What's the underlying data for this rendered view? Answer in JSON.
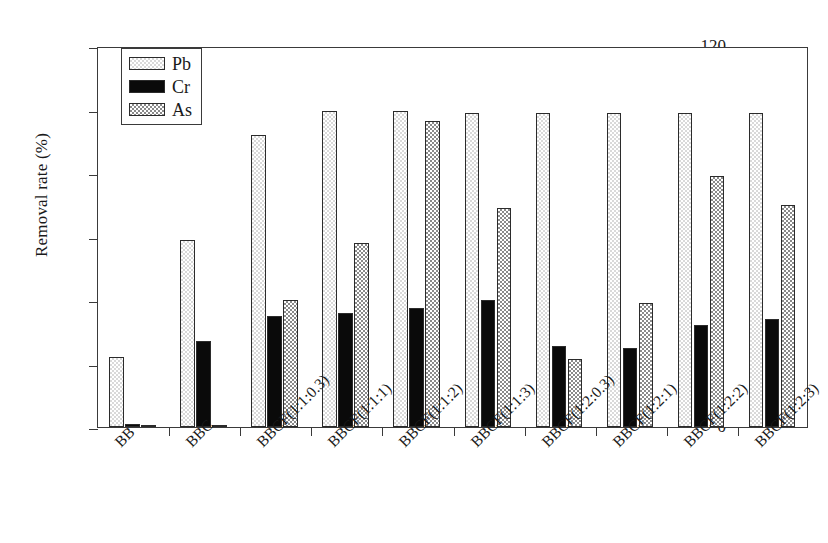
{
  "chart_data": {
    "type": "bar",
    "title": "",
    "xlabel": "",
    "ylabel": "Removal rate (%)",
    "ylim": [
      0,
      120
    ],
    "yticks": [
      0,
      20,
      40,
      60,
      80,
      100,
      120
    ],
    "grid": false,
    "legend_position": "top-left",
    "categories": [
      "BB",
      "BBC",
      "BBCF(1:1:0.3)",
      "BBCF(1:1:1)",
      "BBCF(1:1:2)",
      "BBCF(1:1:3)",
      "BBCF(1:2:0.3)",
      "BBCF(1:2:1)",
      "BBCF(1:2:2)",
      "BBCF(1:2:3)"
    ],
    "series": [
      {
        "name": "Pb",
        "color": "#d9d9d9",
        "pattern": "light-dotted",
        "values": [
          22,
          59,
          92,
          99.5,
          99.5,
          99,
          99,
          99,
          99,
          99
        ]
      },
      {
        "name": "Cr",
        "color": "#0a0a0a",
        "pattern": "solid-black",
        "values": [
          0.8,
          27,
          35,
          36,
          37.5,
          40,
          25.5,
          25,
          32,
          34
        ]
      },
      {
        "name": "As",
        "color": "#8a8a8a",
        "pattern": "dense-dotted",
        "values": [
          0.2,
          0.5,
          40,
          58,
          96.5,
          69,
          21.5,
          39,
          79,
          70
        ]
      }
    ]
  },
  "legend": {
    "items": [
      {
        "label": "Pb"
      },
      {
        "label": "Cr"
      },
      {
        "label": "As"
      }
    ]
  },
  "axis": {
    "y_title": "Removal rate (%)"
  }
}
